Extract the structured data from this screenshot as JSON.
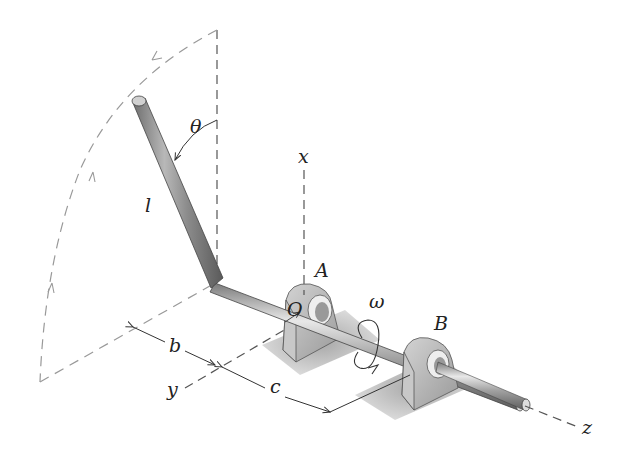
{
  "figure": {
    "labels": {
      "theta": "θ",
      "length": "l",
      "x_axis": "x",
      "y_axis": "y",
      "z_axis": "z",
      "bearing_a": "A",
      "bearing_b": "B",
      "origin": "O",
      "omega": "ω",
      "dim_b": "b",
      "dim_c": "c"
    },
    "colors": {
      "rod": "#9a9a9a",
      "rod_highlight": "#d8d8d8",
      "bearing": "#b5b5b5",
      "shadow": "#c8c8c8",
      "dashed": "#888888",
      "text": "#222222"
    }
  }
}
